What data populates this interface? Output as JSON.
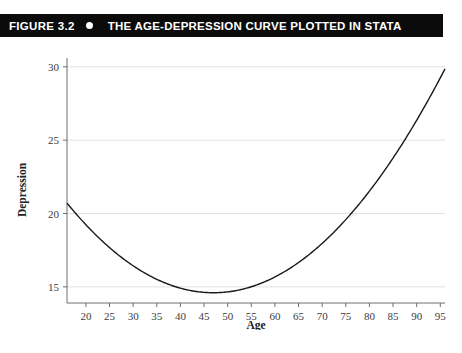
{
  "header": {
    "figure_number": "FIGURE 3.2",
    "bullet_icon": "bullet-dot-icon",
    "title": "THE AGE-DEPRESSION CURVE PLOTTED IN STATA",
    "background_color": "#0b0b0b",
    "text_color": "#ffffff"
  },
  "caption": {
    "clipped_text": ""
  },
  "chart_data": {
    "type": "line",
    "title": "THE AGE-DEPRESSION CURVE PLOTTED IN STATA",
    "xlabel": "Age",
    "ylabel": "Depression",
    "xlim": [
      16,
      96
    ],
    "ylim": [
      13.9,
      30.6
    ],
    "xticks": [
      20,
      25,
      30,
      35,
      40,
      45,
      50,
      55,
      60,
      65,
      70,
      75,
      80,
      85,
      90,
      95
    ],
    "xtick_labels": [
      "20",
      "25",
      "30",
      "35",
      "40",
      "45",
      "50",
      "55",
      "60",
      "65",
      "70",
      "75",
      "80",
      "85",
      "90",
      "95"
    ],
    "yticks": [
      15,
      20,
      25,
      30
    ],
    "ytick_labels": [
      "15",
      "20",
      "25",
      "30"
    ],
    "grid": "horizontal",
    "legend": "none",
    "series": [
      {
        "name": "Predicted depression",
        "curve": "quadratic",
        "vertex_x": 47,
        "vertex_y": 14.6,
        "line_color": "#1a1a1a",
        "x": [
          16,
          20,
          25,
          30,
          35,
          40,
          45,
          50,
          55,
          60,
          65,
          70,
          75,
          80,
          85,
          90,
          95
        ],
        "values": [
          21.1,
          19.8,
          18.3,
          17.0,
          16.0,
          15.2,
          14.7,
          14.6,
          14.8,
          15.3,
          16.1,
          17.2,
          18.6,
          20.3,
          22.3,
          24.6,
          27.6
        ]
      }
    ]
  }
}
